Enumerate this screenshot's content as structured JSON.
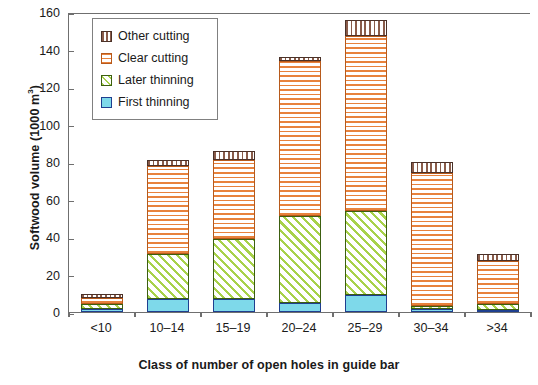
{
  "chart_data": {
    "type": "bar",
    "subtype": "stacked",
    "title": "",
    "xlabel": "Class of number of open holes in guide bar",
    "ylabel": "Softwood volume (1000 m",
    "ylabel_sup": "3",
    "ylabel_tail": ")",
    "ylabel_full": "Softwood volume (1000 m³)",
    "categories": [
      "<10",
      "10–14",
      "15–19",
      "20–24",
      "25–29",
      "30–34",
      ">34"
    ],
    "series": [
      {
        "name": "First thinning",
        "key": "first",
        "color": "#7ed9ea",
        "pattern": "solid",
        "values": [
          1.5,
          7,
          7,
          5,
          9,
          1.5,
          0.5
        ]
      },
      {
        "name": "Later thinning",
        "key": "later",
        "color": "#a8d24a",
        "pattern": "diagonal",
        "values": [
          3,
          24,
          32,
          46,
          45,
          1.5,
          3
        ]
      },
      {
        "name": "Clear cutting",
        "key": "clear",
        "color": "#e8823c",
        "pattern": "horizontal",
        "values": [
          3,
          47,
          42,
          83,
          93,
          71,
          23
        ]
      },
      {
        "name": "Other cutting",
        "key": "other",
        "color": "#8a5c4a",
        "pattern": "vertical",
        "values": [
          2,
          3,
          5,
          2,
          9,
          6,
          4
        ]
      }
    ],
    "totals": [
      9.5,
      81,
      86,
      136,
      156,
      80,
      30.5
    ],
    "ylim": [
      0,
      160
    ],
    "yticks": [
      0,
      20,
      40,
      60,
      80,
      100,
      120,
      140,
      160
    ],
    "ytick_labels": [
      "0",
      "20",
      "40",
      "60",
      "80",
      "100",
      "120",
      "140",
      "160"
    ],
    "grid": false,
    "legend_position": "top-left",
    "legend_order": [
      "Other cutting",
      "Clear cutting",
      "Later thinning",
      "First thinning"
    ]
  },
  "legend": {
    "items": [
      {
        "label": "Other cutting",
        "swatch": "other-cutting-swatch"
      },
      {
        "label": "Clear cutting",
        "swatch": "clear-cutting-swatch"
      },
      {
        "label": "Later thinning",
        "swatch": "later-thinning-swatch"
      },
      {
        "label": "First thinning",
        "swatch": "first-thinning-swatch"
      }
    ]
  }
}
